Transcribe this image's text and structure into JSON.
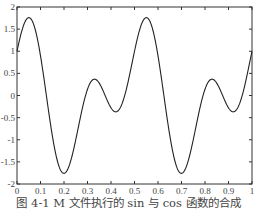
{
  "caption": "图 4-1   M 文件执行的 sin 与 cos 函数的合成",
  "chart_data": {
    "type": "line",
    "title": "",
    "xlabel": "",
    "ylabel": "",
    "xlim": [
      0,
      1
    ],
    "ylim": [
      -2,
      2
    ],
    "grid": false,
    "legend": null,
    "x_ticks": [
      "0",
      "0.1",
      "0.2",
      "0.3",
      "0.4",
      "0.5",
      "0.6",
      "0.7",
      "0.8",
      "0.9",
      "1"
    ],
    "y_ticks": [
      "2",
      "1.5",
      "1",
      "0.5",
      "0",
      "-0.5",
      "-1",
      "-1.5",
      "-2"
    ],
    "series": [
      {
        "name": "y = sin(8πt) + cos(4πt)",
        "x": [
          0,
          0.02,
          0.04,
          0.06,
          0.08,
          0.1,
          0.12,
          0.14,
          0.16,
          0.18,
          0.2,
          0.22,
          0.24,
          0.26,
          0.28,
          0.3,
          0.32,
          0.34,
          0.36,
          0.38,
          0.4,
          0.42,
          0.44,
          0.46,
          0.48,
          0.5,
          0.52,
          0.54,
          0.56,
          0.58,
          0.6,
          0.62,
          0.64,
          0.66,
          0.68,
          0.7,
          0.72,
          0.74,
          0.76,
          0.78,
          0.8,
          0.82,
          0.84,
          0.86,
          0.88,
          0.9,
          0.92,
          0.94,
          0.96,
          0.98,
          1
        ],
        "values": [
          1.0,
          1.45,
          1.69,
          1.73,
          1.58,
          1.26,
          0.8,
          0.25,
          -0.34,
          -0.88,
          -1.31,
          -1.61,
          -1.75,
          -1.72,
          -1.51,
          -1.16,
          -0.71,
          -0.22,
          0.19,
          0.38,
          0.28,
          -0.06,
          -0.36,
          -0.36,
          0.14,
          1.0,
          1.45,
          1.69,
          1.73,
          1.58,
          1.26,
          0.8,
          0.25,
          -0.34,
          -0.88,
          -1.31,
          -1.61,
          -1.75,
          -1.72,
          -1.51,
          -1.16,
          -0.71,
          -0.22,
          0.19,
          0.38,
          0.28,
          -0.06,
          -0.36,
          -0.36,
          0.14,
          1.0
        ],
        "color": "#222222"
      }
    ]
  }
}
